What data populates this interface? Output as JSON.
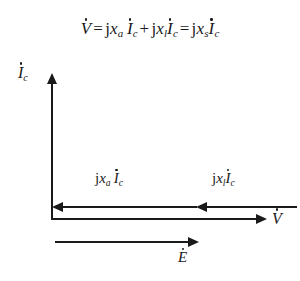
{
  "figure": {
    "type": "phasor-diagram",
    "background_color": "#ffffff",
    "ink_color": "#1a1a1a",
    "equation": {
      "lhs": {
        "symbol": "V",
        "dotted": true
      },
      "terms": [
        {
          "coefficient": "j",
          "reactance": "x",
          "reactance_sub": "a",
          "current": "I",
          "current_sub": "c",
          "dotted": true
        },
        {
          "coefficient": "j",
          "reactance": "x",
          "reactance_sub": "l",
          "current": "I",
          "current_sub": "c",
          "dotted": true
        },
        {
          "coefficient": "j",
          "reactance": "x",
          "reactance_sub": "s",
          "current": "I",
          "current_sub": "c",
          "dotted": true
        }
      ],
      "operators": {
        "equals": "=",
        "plus": "+"
      },
      "plain_text": "V̇ = j x_a İ_c + j x_l İ_c = j x_s İ_c"
    },
    "axes": {
      "vertical": {
        "label_symbol": "I",
        "label_sub": "c",
        "label_dotted": true,
        "label_plain": "İ_c",
        "direction": "up"
      },
      "horizontal": {
        "label_symbol": "V",
        "label_sub": "",
        "label_dotted": true,
        "label_plain": "V̇",
        "direction": "right"
      }
    },
    "vectors": [
      {
        "id": "armature-reaction-drop",
        "label_plain": "j x_a İ_c",
        "coefficient": "j",
        "reactance": "x",
        "reactance_sub": "a",
        "current": "I",
        "current_sub": "c",
        "direction": "left"
      },
      {
        "id": "leakage-reactance-drop",
        "label_plain": "j x_l İ_c",
        "coefficient": "j",
        "reactance": "x",
        "reactance_sub": "l",
        "current": "I",
        "current_sub": "c",
        "direction": "left"
      },
      {
        "id": "induced-emf",
        "label_plain": "Ė",
        "symbol": "E",
        "dotted": true,
        "direction": "right"
      }
    ]
  }
}
